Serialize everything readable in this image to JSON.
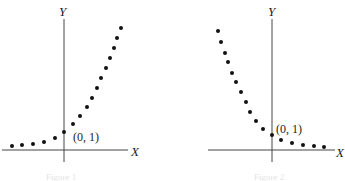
{
  "chart_data": [
    {
      "type": "scatter",
      "title": "",
      "caption": "Figure 1",
      "xlabel": "X",
      "ylabel": "Y",
      "annotation": "(0, 1)",
      "description": "Exponential growth y = a^x, a > 1",
      "grid": false,
      "points_px": [
        [
          12,
          146
        ],
        [
          22,
          145
        ],
        [
          33,
          144
        ],
        [
          44,
          142
        ],
        [
          55,
          138
        ],
        [
          64,
          132
        ],
        [
          73,
          124
        ],
        [
          80,
          116
        ],
        [
          87,
          107
        ],
        [
          92,
          98
        ],
        [
          97,
          88
        ],
        [
          101,
          78
        ],
        [
          106,
          68
        ],
        [
          110,
          58
        ],
        [
          114,
          48
        ],
        [
          117,
          38
        ],
        [
          121,
          28
        ]
      ]
    },
    {
      "type": "scatter",
      "title": "",
      "caption": "Figure 2",
      "xlabel": "X",
      "ylabel": "Y",
      "annotation": "(0, 1)",
      "description": "Exponential decay y = a^x, 0 < a < 1",
      "grid": false,
      "points_px": [
        [
          218,
          31
        ],
        [
          221,
          42
        ],
        [
          225,
          53
        ],
        [
          228,
          62
        ],
        [
          232,
          73
        ],
        [
          236,
          82
        ],
        [
          241,
          92
        ],
        [
          246,
          102
        ],
        [
          250,
          112
        ],
        [
          256,
          121
        ],
        [
          263,
          129
        ],
        [
          272,
          135
        ],
        [
          281,
          140
        ],
        [
          292,
          143
        ],
        [
          303,
          145
        ],
        [
          314,
          146
        ],
        [
          324,
          147
        ]
      ]
    }
  ]
}
